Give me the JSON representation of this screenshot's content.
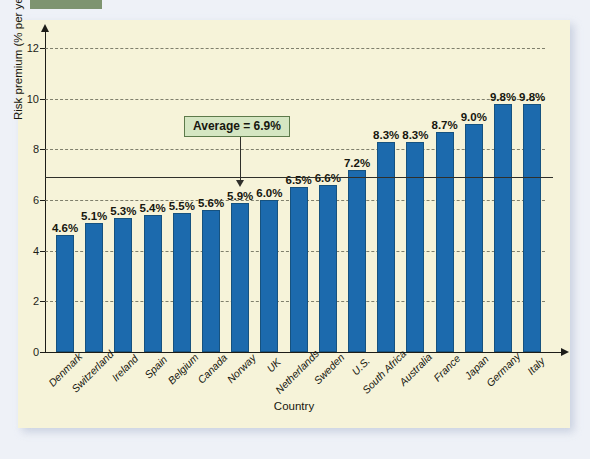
{
  "page": {
    "background_color": "#eef1f7",
    "panel_color": "#f6f3d9",
    "tab_color": "#7e9470"
  },
  "chart_data": {
    "type": "bar",
    "title": "",
    "xlabel": "Country",
    "ylabel": "Risk premium (% per year)",
    "ylim": [
      0,
      12
    ],
    "yticks": [
      0,
      2,
      4,
      6,
      8,
      10,
      12
    ],
    "ytick_labels": [
      "0",
      "2",
      "4",
      "6",
      "8",
      "10",
      "12"
    ],
    "grid": true,
    "grid_style": "dashed-horizontal",
    "legend": "none",
    "bar_color": "#1c6aad",
    "categories": [
      "Denmark",
      "Switzerland",
      "Ireland",
      "Spain",
      "Belgium",
      "Canada",
      "Norway",
      "UK",
      "Netherlands",
      "Sweden",
      "U.S.",
      "South Africa",
      "Australia",
      "France",
      "Japan",
      "Germany",
      "Italy"
    ],
    "values": [
      4.6,
      5.1,
      5.3,
      5.4,
      5.5,
      5.6,
      5.9,
      6.0,
      6.5,
      6.6,
      7.2,
      8.3,
      8.3,
      8.7,
      9.0,
      9.8,
      9.8
    ],
    "value_labels": [
      "4.6%",
      "5.1%",
      "5.3%",
      "5.4%",
      "5.5%",
      "5.6%",
      "5.9%",
      "6.0%",
      "6.5%",
      "6.6%",
      "7.2%",
      "8.3%",
      "8.3%",
      "8.7%",
      "9.0%",
      "9.8%",
      "9.8%"
    ],
    "annotations": [
      {
        "name": "average-line",
        "label": "Average = 6.9%",
        "value": 6.9,
        "style": "solid-horizontal-line-with-callout",
        "box_color": "#d5e6c2",
        "box_border_color": "#5d7a4a"
      }
    ]
  }
}
